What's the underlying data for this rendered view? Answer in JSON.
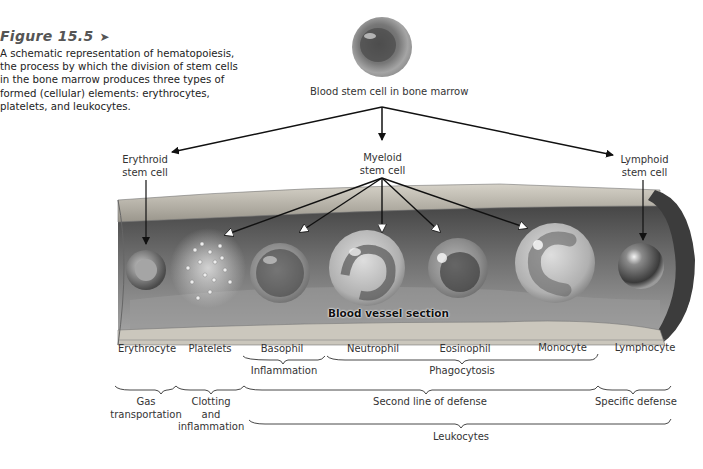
{
  "figure": {
    "label": "Figure 15.5",
    "label_icon": "right-triangle-icon",
    "caption": "A schematic representation of hematopoiesis, the process by which the division of stem cells in the bone marrow produces three types of formed (cellular) elements: erythrocytes, platelets, and leukocytes."
  },
  "diagram": {
    "root": {
      "label": "Blood stem cell in bone marrow"
    },
    "stem_cells": [
      {
        "id": "erythroid",
        "line1": "Erythroid",
        "line2": "stem cell"
      },
      {
        "id": "myeloid",
        "line1": "Myeloid",
        "line2": "stem cell"
      },
      {
        "id": "lymphoid",
        "line1": "Lymphoid",
        "line2": "stem cell"
      }
    ],
    "vessel_label": "Blood vessel section",
    "cells": [
      {
        "name": "Erythrocyte",
        "source": "erythroid"
      },
      {
        "name": "Platelets",
        "source": "myeloid"
      },
      {
        "name": "Basophil",
        "source": "myeloid"
      },
      {
        "name": "Neutrophil",
        "source": "myeloid"
      },
      {
        "name": "Eosinophil",
        "source": "myeloid"
      },
      {
        "name": "Monocyte",
        "source": "myeloid"
      },
      {
        "name": "Lymphocyte",
        "source": "lymphoid"
      }
    ],
    "function_groups_row1": [
      {
        "label": "Inflammation",
        "covers": [
          "Basophil"
        ]
      },
      {
        "label": "Phagocytosis",
        "covers": [
          "Neutrophil",
          "Eosinophil",
          "Monocyte"
        ]
      }
    ],
    "function_groups_row2": [
      {
        "label": "Gas transportation",
        "line1": "Gas",
        "line2": "transportation",
        "covers": [
          "Erythrocyte"
        ]
      },
      {
        "label": "Clotting and inflammation",
        "line1": "Clotting",
        "line2": "and",
        "line3": "inflammation",
        "covers": [
          "Platelets"
        ]
      },
      {
        "label": "Second line of defense",
        "covers": [
          "Basophil",
          "Neutrophil",
          "Eosinophil",
          "Monocyte"
        ]
      },
      {
        "label": "Specific defense",
        "covers": [
          "Lymphocyte"
        ]
      }
    ],
    "function_groups_row3": [
      {
        "label": "Leukocytes",
        "covers": [
          "Basophil",
          "Neutrophil",
          "Eosinophil",
          "Monocyte",
          "Lymphocyte"
        ]
      }
    ]
  }
}
